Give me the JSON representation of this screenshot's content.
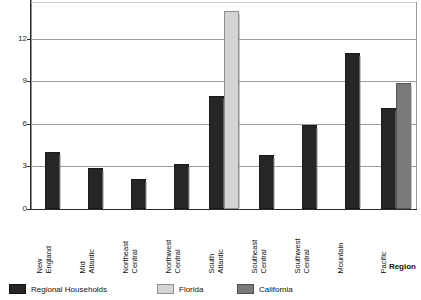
{
  "chart_data": {
    "type": "bar",
    "title": "",
    "subtitle": "",
    "xlabel": "Region",
    "ylabel": "",
    "ylim": [
      0,
      14.6
    ],
    "yticks": [
      0,
      3,
      6,
      9,
      12
    ],
    "ytick_labels": [
      "0",
      "3",
      "6",
      "9",
      "12"
    ],
    "grid": true,
    "legend_position": "bottom-left",
    "categories": [
      "New England",
      "Mid Atlantic",
      "Northeast Central",
      "Northwest Central",
      "South Atlantic",
      "Southeast Central",
      "Southwest Central",
      "Mountain",
      "Pacific"
    ],
    "category_lines": [
      [
        "New",
        "England"
      ],
      [
        "Mid",
        "Atlantic"
      ],
      [
        "Northeast",
        "Central"
      ],
      [
        "Northwest",
        "Central"
      ],
      [
        "South",
        "Atlantic"
      ],
      [
        "Southeast",
        "Central"
      ],
      [
        "Southwest",
        "Central"
      ],
      [
        "Mountain",
        ""
      ],
      [
        "Pacific",
        ""
      ]
    ],
    "series": [
      {
        "name": "Regional Households",
        "color": "#262626",
        "values": [
          4.0,
          2.9,
          2.1,
          3.2,
          8.0,
          3.8,
          5.9,
          11.0,
          7.1
        ]
      },
      {
        "name": "Florida",
        "color": "#d4d4d4",
        "values": [
          null,
          null,
          null,
          null,
          14.0,
          null,
          null,
          null,
          null
        ]
      },
      {
        "name": "California",
        "color": "#7a7a7a",
        "values": [
          null,
          null,
          null,
          null,
          null,
          null,
          null,
          null,
          8.9
        ]
      }
    ]
  },
  "axis": {
    "y_tick_0": "0",
    "y_tick_1": "3",
    "y_tick_2": "6",
    "y_tick_3": "9",
    "y_tick_4": "12",
    "x_title": "Region"
  },
  "legend": {
    "items": [
      {
        "label": "Regional Households",
        "swatch": "dark"
      },
      {
        "label": "Florida",
        "swatch": "light"
      },
      {
        "label": "California",
        "swatch": "mid"
      }
    ]
  },
  "categories_text": {
    "c0l1": "New",
    "c0l2": "England",
    "c1l1": "Mid",
    "c1l2": "Atlantic",
    "c2l1": "Northeast",
    "c2l2": "Central",
    "c3l1": "Northwest",
    "c3l2": "Central",
    "c4l1": "South",
    "c4l2": "Atlantic",
    "c5l1": "Southeast",
    "c5l2": "Central",
    "c6l1": "Southwest",
    "c6l2": "Central",
    "c7l1": "Mountain",
    "c7l2": "",
    "c8l1": "Pacific",
    "c8l2": ""
  }
}
